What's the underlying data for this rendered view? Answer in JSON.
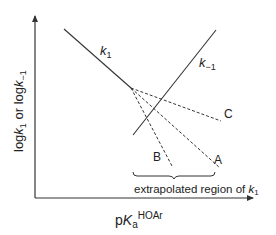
{
  "diagram": {
    "y_axis_label": {
      "main": "log",
      "k1": "k",
      "k1_sub": "1",
      "mid": " or log",
      "km1": "k",
      "km1_sub": "−1"
    },
    "x_axis_label": {
      "main": "p",
      "K": "K",
      "sub": "a",
      "sup": "HOAr"
    },
    "lines": {
      "k1": {
        "label": "k",
        "sub": "1"
      },
      "k_minus1": {
        "label": "k",
        "sub": "−1"
      }
    },
    "extrapolations": [
      {
        "label": "A"
      },
      {
        "label": "B"
      },
      {
        "label": "C"
      }
    ],
    "region": {
      "text": "extrapolated region of ",
      "k": "k",
      "sub": "1"
    },
    "colors": {
      "line": "#333333",
      "background": "#ffffff"
    }
  }
}
